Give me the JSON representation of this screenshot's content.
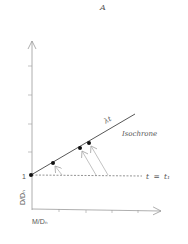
{
  "title": "A",
  "axes": {
    "y_label": "D/Dₙ",
    "x_label": "M/Dₙ",
    "y_tick_label": "1"
  },
  "isochrone": {
    "slope_label": "λt",
    "name": "Isochrone"
  },
  "reference_line": {
    "label_var": "t",
    "label_eq": "=",
    "label_val": "t₁"
  },
  "colors": {
    "axis": "#9a9a9a",
    "line": "#444444",
    "dot": "#111111",
    "arrow": "#a8a8a8",
    "text": "#555555"
  },
  "points": {
    "count": 4
  }
}
